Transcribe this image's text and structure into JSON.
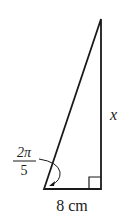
{
  "diagram": {
    "type": "right-triangle",
    "vertices": {
      "apex": [
        101,
        19
      ],
      "bottom_left": [
        44,
        189
      ],
      "bottom_right": [
        101,
        189
      ]
    },
    "labels": {
      "side_vertical": "x",
      "side_base": "8 cm",
      "angle_numerator": "2π",
      "angle_denominator": "5"
    },
    "right_angle_marker": true,
    "colors": {
      "stroke": "#1a1a1a",
      "background": "#ffffff"
    }
  }
}
